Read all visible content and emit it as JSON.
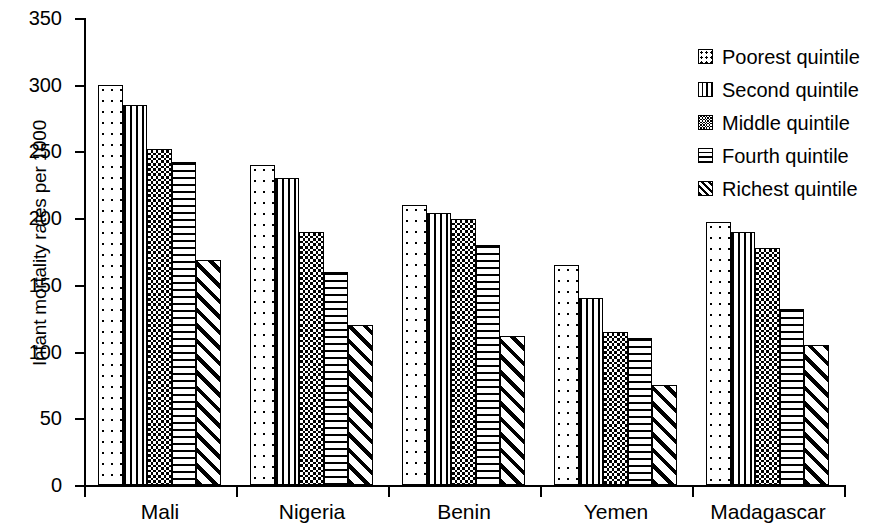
{
  "chart_data": {
    "type": "bar",
    "title": "",
    "xlabel": "",
    "ylabel": "Infant mortality rates per 1000",
    "ylim": [
      0,
      350
    ],
    "yticks": [
      0,
      50,
      100,
      150,
      200,
      250,
      300,
      350
    ],
    "grid": false,
    "legend_position": "right",
    "categories": [
      "Mali",
      "Nigeria",
      "Benin",
      "Yemen",
      "Madagascar"
    ],
    "series": [
      {
        "name": "Poorest quintile",
        "pattern": "dots",
        "values": [
          300,
          240,
          210,
          165,
          197
        ]
      },
      {
        "name": "Second quintile",
        "pattern": "vertical-lines",
        "values": [
          285,
          230,
          204,
          140,
          190
        ]
      },
      {
        "name": "Middle quintile",
        "pattern": "checkered",
        "values": [
          252,
          190,
          199,
          115,
          178
        ]
      },
      {
        "name": "Fourth quintile",
        "pattern": "horizontal-lines",
        "values": [
          242,
          160,
          180,
          110,
          132
        ]
      },
      {
        "name": "Richest quintile",
        "pattern": "diagonal-hatch",
        "values": [
          169,
          120,
          112,
          75,
          105
        ]
      }
    ]
  },
  "legend": {
    "items": [
      {
        "label": "Poorest quintile",
        "swatch": "dots-swatch-icon"
      },
      {
        "label": "Second quintile",
        "swatch": "vertical-lines-swatch-icon"
      },
      {
        "label": "Middle quintile",
        "swatch": "checkered-swatch-icon"
      },
      {
        "label": "Fourth quintile",
        "swatch": "horizontal-lines-swatch-icon"
      },
      {
        "label": "Richest quintile",
        "swatch": "diagonal-hatch-swatch-icon"
      }
    ]
  }
}
